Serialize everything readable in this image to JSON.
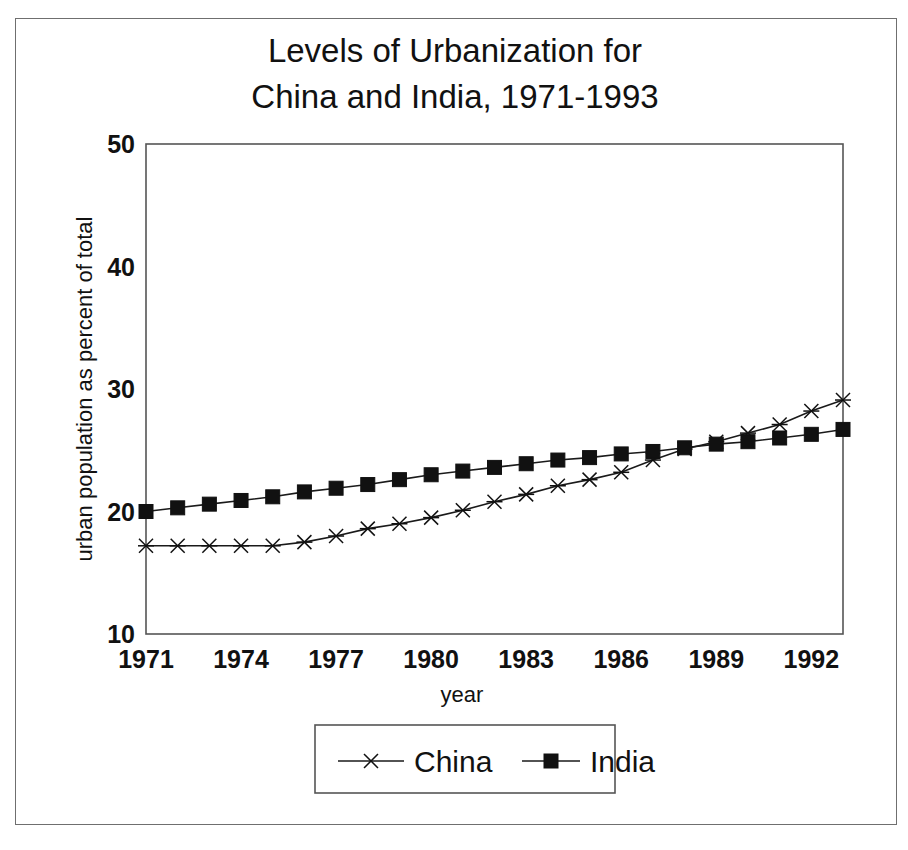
{
  "figure": {
    "title_line1": "Levels of Urbanization for",
    "title_line2": "China and India, 1971-1993",
    "background_color": "#ffffff",
    "ink_color": "#111111",
    "frame_color": "#555555"
  },
  "axes": {
    "x_title": "year",
    "y_title": "urban population as percent of total",
    "x_tick_labels": [
      "1971",
      "1974",
      "1977",
      "1980",
      "1983",
      "1986",
      "1989",
      "1992"
    ],
    "y_tick_labels": [
      "10",
      "20",
      "30",
      "40",
      "50"
    ]
  },
  "legend": {
    "entries": [
      {
        "label": "China",
        "marker": "x-marker",
        "color": "#111111"
      },
      {
        "label": "India",
        "marker": "square-marker",
        "color": "#111111"
      }
    ]
  },
  "chart_data": {
    "type": "line",
    "title": "Levels of Urbanization for China and India, 1971-1993",
    "xlabel": "year",
    "ylabel": "urban population as percent of total",
    "xlim": [
      1971,
      1993
    ],
    "ylim": [
      10,
      50
    ],
    "xticks": [
      1971,
      1974,
      1977,
      1980,
      1983,
      1986,
      1989,
      1992
    ],
    "yticks": [
      10,
      20,
      30,
      40,
      50
    ],
    "grid": false,
    "legend_position": "below-axes",
    "x": [
      1971,
      1972,
      1973,
      1974,
      1975,
      1976,
      1977,
      1978,
      1979,
      1980,
      1981,
      1982,
      1983,
      1984,
      1985,
      1986,
      1987,
      1988,
      1989,
      1990,
      1991,
      1992,
      1993
    ],
    "series": [
      {
        "name": "China",
        "marker": "x",
        "color": "#111111",
        "values": [
          17.2,
          17.2,
          17.2,
          17.2,
          17.2,
          17.5,
          18.0,
          18.6,
          19.0,
          19.5,
          20.1,
          20.8,
          21.4,
          22.1,
          22.6,
          23.2,
          24.2,
          25.1,
          25.7,
          26.4,
          27.1,
          28.2,
          29.1
        ]
      },
      {
        "name": "India",
        "marker": "square",
        "color": "#111111",
        "values": [
          20.0,
          20.3,
          20.6,
          20.9,
          21.2,
          21.6,
          21.9,
          22.2,
          22.6,
          23.0,
          23.3,
          23.6,
          23.9,
          24.2,
          24.4,
          24.7,
          24.9,
          25.2,
          25.5,
          25.7,
          26.0,
          26.3,
          26.7
        ]
      }
    ]
  }
}
